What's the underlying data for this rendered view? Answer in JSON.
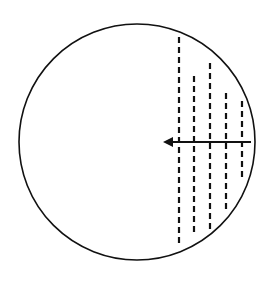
{
  "diagram": {
    "type": "circle-with-dashed-chords-and-arrow",
    "background": "#ffffff",
    "stroke_color": "#111111",
    "circle": {
      "cx": 137,
      "cy": 142,
      "r": 118,
      "stroke_width": 1.6
    },
    "dashed_lines": [
      {
        "x": 179,
        "y1": 37,
        "y2": 247
      },
      {
        "x": 194,
        "y1": 76,
        "y2": 232
      },
      {
        "x": 210,
        "y1": 63,
        "y2": 230
      },
      {
        "x": 226,
        "y1": 93,
        "y2": 213
      },
      {
        "x": 242,
        "y1": 101,
        "y2": 180
      }
    ],
    "dash_pattern": "6,4",
    "dash_width": 2.2,
    "arrow": {
      "x_start": 251,
      "x_end": 163,
      "y": 142,
      "direction": "left",
      "stroke_width": 2.2
    }
  }
}
